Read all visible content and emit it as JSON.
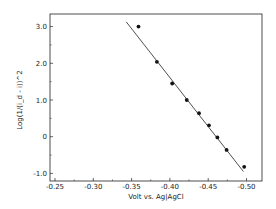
{
  "chart_data": {
    "type": "scatter",
    "title": "",
    "xlabel": "Volt vs. Ag|AgCl",
    "ylabel": "Log(1/(i_d - i))^2",
    "xlim": [
      -0.23,
      -0.52
    ],
    "ylim": [
      -1.1,
      3.5
    ],
    "x_ticks": [
      -0.25,
      -0.3,
      -0.35,
      -0.4,
      -0.45,
      -0.5
    ],
    "x_tick_labels": [
      "-0.25",
      "-0.30",
      "-0.35",
      "-0.40",
      "-0.45",
      "-0.50"
    ],
    "y_ticks": [
      3.0,
      2.0,
      1.0,
      0,
      -1.0
    ],
    "y_tick_labels": [
      "3.0",
      "2.0",
      "1.0",
      "0",
      "-1.0"
    ],
    "grid": false,
    "legend": null,
    "series": [
      {
        "name": "measured",
        "kind": "points",
        "x": [
          -0.359,
          -0.383,
          -0.403,
          -0.422,
          -0.438,
          -0.451,
          -0.462,
          -0.474,
          -0.497
        ],
        "y": [
          3.0,
          2.04,
          1.45,
          1.0,
          0.64,
          0.31,
          -0.02,
          -0.36,
          -0.82
        ]
      },
      {
        "name": "linear fit",
        "kind": "line",
        "x": [
          -0.343,
          -0.496
        ],
        "y": [
          3.13,
          -0.95
        ]
      }
    ]
  },
  "colors": {
    "ink": "#222222",
    "background": "#ffffff"
  }
}
